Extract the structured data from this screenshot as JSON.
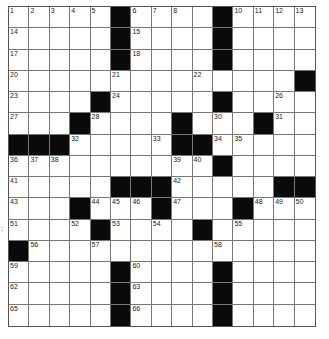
{
  "puzzle": {
    "rows": 15,
    "cols": 15,
    "layout": [
      ".....#....#....",
      ".....#....#....",
      ".....#....#....",
      "..............#",
      "....#.....#....",
      "...#....#...#..",
      "###.....##.....",
      "..........#....",
      ".....###.....##",
      "...#...#...#...",
      "....#....#.....",
      "#..............",
      ".....#....#....",
      ".....#....#....",
      ".....#....#...."
    ],
    "numbers": [
      [
        1,
        2,
        3,
        4,
        5,
        0,
        6,
        7,
        8,
        0,
        9,
        10,
        11,
        12,
        13
      ],
      [
        14,
        0,
        0,
        0,
        0,
        0,
        15,
        0,
        0,
        0,
        16,
        0,
        0,
        0,
        0
      ],
      [
        17,
        0,
        0,
        0,
        0,
        0,
        18,
        0,
        0,
        0,
        19,
        0,
        0,
        0,
        0
      ],
      [
        20,
        0,
        0,
        0,
        0,
        21,
        0,
        0,
        0,
        22,
        0,
        0,
        0,
        0,
        0
      ],
      [
        23,
        0,
        0,
        0,
        0,
        24,
        0,
        0,
        0,
        0,
        25,
        0,
        0,
        26,
        0
      ],
      [
        27,
        0,
        0,
        0,
        28,
        0,
        0,
        0,
        29,
        0,
        30,
        0,
        0,
        31,
        0
      ],
      [
        0,
        0,
        0,
        32,
        0,
        0,
        0,
        33,
        0,
        0,
        34,
        35,
        0,
        0,
        0
      ],
      [
        36,
        37,
        38,
        0,
        0,
        0,
        0,
        0,
        39,
        40,
        0,
        0,
        0,
        0,
        0
      ],
      [
        41,
        0,
        0,
        0,
        0,
        0,
        0,
        0,
        42,
        0,
        0,
        0,
        0,
        0,
        0
      ],
      [
        43,
        0,
        0,
        0,
        44,
        45,
        46,
        0,
        47,
        0,
        0,
        0,
        48,
        49,
        50
      ],
      [
        51,
        0,
        0,
        52,
        0,
        53,
        0,
        54,
        0,
        0,
        0,
        55,
        0,
        0,
        0
      ],
      [
        0,
        56,
        0,
        0,
        57,
        0,
        0,
        0,
        0,
        0,
        58,
        0,
        0,
        0,
        0
      ],
      [
        59,
        0,
        0,
        0,
        0,
        0,
        60,
        0,
        0,
        0,
        61,
        0,
        0,
        0,
        0
      ],
      [
        62,
        0,
        0,
        0,
        0,
        0,
        63,
        0,
        0,
        0,
        64,
        0,
        0,
        0,
        0
      ],
      [
        65,
        0,
        0,
        0,
        0,
        0,
        66,
        0,
        0,
        0,
        67,
        0,
        0,
        0,
        0
      ]
    ],
    "margin_mark": ":",
    "colors": {
      "black": "#0a0a0a",
      "white": "#ffffff",
      "line": "#777777"
    }
  }
}
